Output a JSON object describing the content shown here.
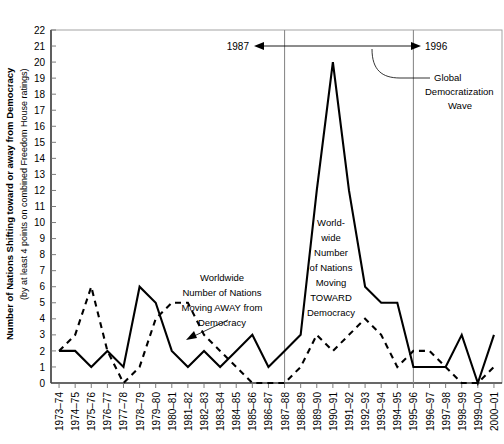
{
  "chart_data": {
    "type": "line",
    "title": "",
    "xlabel": "",
    "ylabel": "Number of Nations Shifting toward or away from Democracy",
    "ylabel_sub": "(by at least 4 points on combined Freedom House ratings)",
    "ylim": [
      0,
      22
    ],
    "yticks": [
      0,
      1,
      2,
      3,
      4,
      5,
      6,
      7,
      8,
      9,
      10,
      11,
      12,
      13,
      14,
      15,
      16,
      17,
      18,
      19,
      20,
      21,
      22
    ],
    "grid": false,
    "legend_position": "inline-annotations",
    "categories": [
      "1973–74",
      "1974–75",
      "1975–76",
      "1976–77",
      "1977–78",
      "1978–79",
      "1979–80",
      "1980–81",
      "1981–82",
      "1982–83",
      "1983–84",
      "1984–85",
      "1985–86",
      "1986–87",
      "1987–88",
      "1988–89",
      "1989–90",
      "1990–91",
      "1991–92",
      "1992–93",
      "1993–94",
      "1994–95",
      "1995–96",
      "1996–97",
      "1997–98",
      "1998–99",
      "1999–00",
      "2000–01"
    ],
    "series": [
      {
        "name": "Worldwide Number of Nations Moving TOWARD Democracy",
        "style": "solid",
        "values": [
          2,
          2,
          1,
          2,
          1,
          6,
          5,
          2,
          1,
          2,
          1,
          2,
          3,
          1,
          2,
          3,
          12,
          20,
          12,
          6,
          5,
          5,
          1,
          1,
          1,
          3,
          0,
          3
        ]
      },
      {
        "name": "Worldwide Number of Nations Moving AWAY from Democracy",
        "style": "dashed",
        "values": [
          2,
          3,
          6,
          2,
          0,
          1,
          4,
          5,
          5,
          3,
          2,
          1,
          0,
          0,
          0,
          1,
          3,
          2,
          3,
          4,
          3,
          1,
          2,
          2,
          1,
          0,
          0,
          1
        ]
      }
    ],
    "annotations": [
      {
        "id": "range-start",
        "text": "1987"
      },
      {
        "id": "range-end",
        "text": "1996"
      },
      {
        "id": "wave-callout",
        "text": "Global Democratization Wave"
      },
      {
        "id": "away-callout",
        "text": "Worldwide Number of Nations Moving AWAY from Democracy"
      },
      {
        "id": "toward-callout",
        "text": "World-wide Number of Nations Moving TOWARD Democracy"
      }
    ],
    "reference_lines": [
      {
        "label": "1987",
        "at_category": "1987–88"
      },
      {
        "label": "1996",
        "at_category": "1995–96"
      }
    ]
  },
  "labels": {
    "y_axis_main": "Number of Nations Shifting toward or away from Democracy",
    "y_axis_sub": "(by at least 4 points on combined Freedom House ratings)",
    "year_start": "1987",
    "year_end": "1996",
    "callout_wave_1": "Global",
    "callout_wave_2": "Democratization",
    "callout_wave_3": "Wave",
    "callout_away_1": "Worldwide",
    "callout_away_2": "Number of Nations",
    "callout_away_3": "Moving AWAY from",
    "callout_away_4": "Democracy",
    "callout_toward_1": "World-",
    "callout_toward_2": "wide",
    "callout_toward_3": "Number",
    "callout_toward_4": "of Nations",
    "callout_toward_5": "Moving",
    "callout_toward_6": "TOWARD",
    "callout_toward_7": "Democracy"
  },
  "colors": {
    "line": "#000000",
    "frame": "#9a9a9a",
    "refline": "#8c8c8c",
    "background": "#ffffff"
  }
}
